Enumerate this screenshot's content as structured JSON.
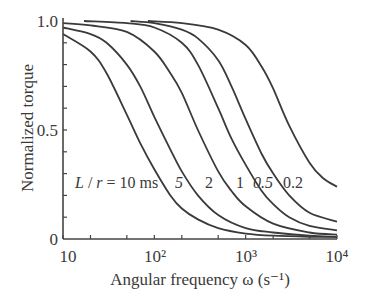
{
  "chart_data": {
    "type": "line",
    "title": "",
    "xlabel": "Angular frequency ω (s⁻¹)",
    "ylabel": "Normalized torque",
    "xscale": "log",
    "xlim": [
      10,
      10000
    ],
    "ylim": [
      0,
      1.0
    ],
    "x_ticks": [
      "10",
      "10²",
      "10³",
      "10⁴"
    ],
    "y_ticks": [
      "0",
      "0.5",
      "1.0"
    ],
    "grid": false,
    "legend": "inline curve labels",
    "annotation": "L / r = 10 ms",
    "series": [
      {
        "name": "L/r = 10 ms",
        "label": "L / r = 10 ms",
        "x": [
          10,
          20,
          30,
          50,
          70,
          100,
          150,
          200,
          300,
          500,
          1000,
          2000,
          5000,
          10000
        ],
        "values": [
          0.94,
          0.86,
          0.76,
          0.57,
          0.44,
          0.32,
          0.2,
          0.14,
          0.09,
          0.05,
          0.025,
          0.015,
          0.01,
          0.01
        ]
      },
      {
        "name": "L/r = 5 ms",
        "label": "5",
        "x": [
          10,
          20,
          30,
          50,
          70,
          100,
          150,
          200,
          300,
          500,
          1000,
          2000,
          5000,
          10000
        ],
        "values": [
          0.97,
          0.94,
          0.9,
          0.8,
          0.7,
          0.56,
          0.41,
          0.31,
          0.2,
          0.11,
          0.05,
          0.03,
          0.015,
          0.01
        ]
      },
      {
        "name": "L/r = 2 ms",
        "label": "2",
        "x": [
          10,
          20,
          50,
          100,
          150,
          200,
          300,
          500,
          700,
          1000,
          2000,
          5000,
          10000
        ],
        "values": [
          0.99,
          0.98,
          0.95,
          0.86,
          0.76,
          0.67,
          0.5,
          0.31,
          0.22,
          0.15,
          0.07,
          0.03,
          0.02
        ]
      },
      {
        "name": "L/r = 1 ms",
        "label": "1",
        "x": [
          17,
          50,
          100,
          200,
          300,
          500,
          700,
          1000,
          1500,
          2000,
          3000,
          5000,
          10000
        ],
        "values": [
          1.0,
          0.99,
          0.97,
          0.9,
          0.8,
          0.6,
          0.46,
          0.34,
          0.22,
          0.16,
          0.1,
          0.06,
          0.04
        ]
      },
      {
        "name": "L/r = 0.5 ms",
        "label": "0.5",
        "x": [
          55,
          100,
          200,
          300,
          500,
          700,
          1000,
          1500,
          2000,
          3000,
          5000,
          10000
        ],
        "values": [
          1.0,
          0.99,
          0.96,
          0.92,
          0.82,
          0.7,
          0.55,
          0.39,
          0.3,
          0.2,
          0.12,
          0.08
        ]
      },
      {
        "name": "L/r = 0.2 ms",
        "label": "0.2",
        "x": [
          85,
          200,
          500,
          1000,
          1500,
          2000,
          3000,
          5000,
          7000,
          10000
        ],
        "values": [
          1.0,
          0.99,
          0.96,
          0.89,
          0.79,
          0.69,
          0.52,
          0.35,
          0.28,
          0.24
        ]
      }
    ]
  }
}
